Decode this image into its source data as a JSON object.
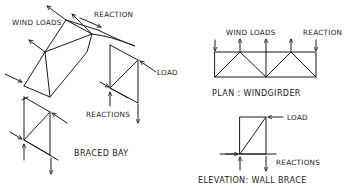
{
  "diagram": {
    "type": "structural-bracing-sketch",
    "panels": [
      {
        "id": "braced-bay",
        "title": "BRACED BAY",
        "labels": {
          "wind_loads": "WIND LOADS",
          "reaction": "REACTION",
          "load": "LOAD",
          "reactions": "REACTIONS"
        }
      },
      {
        "id": "windgirder",
        "title": "PLAN : WINDGIRDER",
        "labels": {
          "wind_loads": "WIND LOADS",
          "reaction": "REACTION"
        }
      },
      {
        "id": "wall-brace",
        "title": "ELEVATION: WALL BRACE",
        "labels": {
          "load": "LOAD",
          "reactions": "REACTIONS"
        }
      }
    ],
    "colors": {
      "ink": "#1a1a1a",
      "background": "#ffffff"
    }
  }
}
